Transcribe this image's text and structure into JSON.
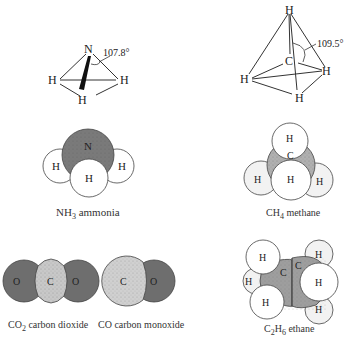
{
  "ammonia_structure": {
    "center_atom": "N",
    "hydrogens": [
      "H",
      "H",
      "H"
    ],
    "bond_angle": "107.8°"
  },
  "methane_structure": {
    "center_atom": "C",
    "hydrogens": [
      "H",
      "H",
      "H",
      "H"
    ],
    "bond_angle": "109.5°"
  },
  "ammonia_model": {
    "atoms": [
      "N",
      "H",
      "H",
      "H"
    ],
    "caption_formula": "NH",
    "caption_sub": "3",
    "caption_name": " ammonia"
  },
  "methane_model": {
    "atoms": [
      "H",
      "C",
      "H",
      "H",
      "H"
    ],
    "caption_formula": "CH",
    "caption_sub": "4",
    "caption_name": " methane"
  },
  "co2_model": {
    "atoms": [
      "O",
      "C",
      "O"
    ],
    "caption_formula": "CO",
    "caption_sub": "2",
    "caption_name": " carbon dioxide"
  },
  "co_model": {
    "atoms": [
      "C",
      "O"
    ],
    "caption_text": "CO carbon monoxide"
  },
  "ethane_model": {
    "atoms": [
      "H",
      "C",
      "C",
      "H",
      "H",
      "H",
      "H",
      "H"
    ],
    "caption_c": "C",
    "caption_c_sub": "2",
    "caption_h": "H",
    "caption_h_sub": "6",
    "caption_name": " ethane"
  },
  "colors": {
    "dark_atom": "#6e6e6e",
    "mid_atom": "#b3b3b3",
    "light_atom": "#dcdcdc",
    "hydrogen": "#ffffff",
    "outline": "#444444"
  }
}
